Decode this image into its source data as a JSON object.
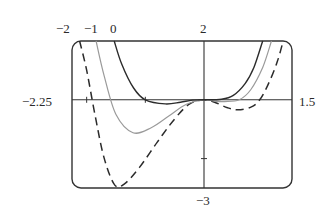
{
  "chart_data": {
    "type": "line",
    "title": "",
    "xlabel": "",
    "ylabel": "",
    "xlim": [
      -2.25,
      1.5
    ],
    "ylim": [
      -3,
      2
    ],
    "grid": false,
    "legend": "curve labels placed above the plot box at the top crossings",
    "axis_labels": {
      "x_min": "−2.25",
      "x_max": "1.5",
      "y_max": "2",
      "y_min": "−3"
    },
    "ticks": {
      "x": [
        -2,
        -1
      ],
      "y": [
        -2
      ]
    },
    "series": [
      {
        "name": "−2",
        "style": "dashed",
        "color": "#2b2b2b",
        "x": [
          -2.12,
          -2.0,
          -1.85,
          -1.7,
          -1.52,
          -1.35,
          -1.1,
          -0.8,
          -0.5,
          -0.25,
          0.0,
          0.2,
          0.4,
          0.58,
          0.8,
          0.95,
          1.1,
          1.25,
          1.35
        ],
        "y": [
          2.0,
          1.0,
          -0.6,
          -2.0,
          -2.9,
          -2.85,
          -2.3,
          -1.45,
          -0.65,
          -0.15,
          0.0,
          -0.1,
          -0.27,
          -0.34,
          -0.25,
          0.0,
          0.55,
          1.3,
          2.0
        ]
      },
      {
        "name": "−1",
        "style": "solid",
        "color": "#9a9a9a",
        "x": [
          -1.84,
          -1.7,
          -1.5,
          -1.21,
          -0.9,
          -0.6,
          -0.3,
          0.0,
          0.2,
          0.35,
          0.6,
          0.8,
          1.0,
          1.15
        ],
        "y": [
          2.0,
          0.8,
          -0.5,
          -1.12,
          -0.95,
          -0.55,
          -0.15,
          0.0,
          -0.05,
          -0.06,
          0.0,
          0.35,
          1.1,
          2.0
        ]
      },
      {
        "name": "0",
        "style": "solid",
        "color": "#2b2b2b",
        "x": [
          -1.53,
          -1.4,
          -1.2,
          -1.0,
          -0.66,
          -0.4,
          -0.2,
          0.0,
          0.3,
          0.5,
          0.7,
          0.85,
          1.0
        ],
        "y": [
          2.0,
          1.2,
          0.4,
          0.0,
          -0.14,
          -0.08,
          -0.01,
          0.0,
          0.02,
          0.15,
          0.55,
          1.1,
          2.0
        ]
      }
    ]
  }
}
